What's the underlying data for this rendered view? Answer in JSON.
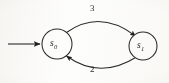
{
  "figure": {
    "kind": "state-transition-diagram",
    "width": 169,
    "height": 83,
    "background_color": "#fdfdfc",
    "stroke_color": "#2b2b2b"
  },
  "states": [
    {
      "id": "s0",
      "symbol": "s",
      "subscript": "0",
      "is_start": true,
      "cx": 57,
      "cy": 44,
      "r": 15
    },
    {
      "id": "s1",
      "symbol": "s",
      "subscript": "1",
      "is_start": false,
      "cx": 143,
      "cy": 46,
      "r": 14
    }
  ],
  "start_arrow": {
    "label": "",
    "from_x": 8,
    "to_x": 41,
    "y": 44
  },
  "transitions": [
    {
      "id": "t-s0-s1",
      "from": "s0",
      "to": "s1",
      "label": "3",
      "position": "top"
    },
    {
      "id": "t-s1-s0",
      "from": "s1",
      "to": "s0",
      "label": "2",
      "position": "bottom"
    }
  ]
}
